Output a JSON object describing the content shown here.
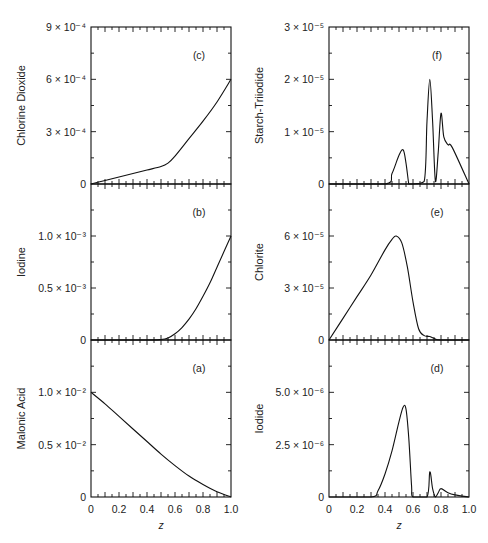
{
  "chart_data": [
    {
      "id": "c",
      "type": "line",
      "panel_label": "(c)",
      "ylabel": "Chlorine Dioxide",
      "xlabel": "",
      "ylim": [
        0,
        0.0009
      ],
      "yticks": [
        {
          "v": 0,
          "label": "0"
        },
        {
          "v": 0.0003,
          "label": "3 × 10⁻⁴"
        },
        {
          "v": 0.0006,
          "label": "6 × 10⁻⁴"
        },
        {
          "v": 0.0009,
          "label": "9 × 10⁻⁴"
        }
      ],
      "x": [
        0,
        0.1,
        0.2,
        0.3,
        0.4,
        0.5,
        0.55,
        0.6,
        0.7,
        0.8,
        0.9,
        1.0
      ],
      "y": [
        0,
        2e-05,
        4e-05,
        6e-05,
        8e-05,
        0.0001,
        0.00012,
        0.00016,
        0.00026,
        0.00036,
        0.00047,
        0.0006
      ]
    },
    {
      "id": "b",
      "type": "line",
      "panel_label": "(b)",
      "ylabel": "Iodine",
      "xlabel": "",
      "ylim": [
        0,
        0.0015
      ],
      "yticks": [
        {
          "v": 0,
          "label": "0"
        },
        {
          "v": 0.0005,
          "label": "0.5 × 10⁻³"
        },
        {
          "v": 0.001,
          "label": "1.0 × 10⁻³"
        }
      ],
      "x": [
        0,
        0.4,
        0.5,
        0.55,
        0.6,
        0.65,
        0.7,
        0.75,
        0.8,
        0.85,
        0.9,
        0.95,
        1.0
      ],
      "y": [
        0,
        0,
        5e-06,
        2e-05,
        6e-05,
        0.00012,
        0.0002,
        0.0003,
        0.00042,
        0.00055,
        0.0007,
        0.00085,
        0.001
      ]
    },
    {
      "id": "a",
      "type": "line",
      "panel_label": "(a)",
      "ylabel": "Malonic Acid",
      "xlabel": "z",
      "ylim": [
        0,
        0.015
      ],
      "yticks": [
        {
          "v": 0,
          "label": "0"
        },
        {
          "v": 0.005,
          "label": "0.5 × 10⁻²"
        },
        {
          "v": 0.01,
          "label": "1.0 × 10⁻²"
        }
      ],
      "xticks": [
        "0",
        "0.2",
        "0.4",
        "0.6",
        "0.8",
        "1.0"
      ],
      "x": [
        0,
        0.1,
        0.2,
        0.3,
        0.4,
        0.5,
        0.6,
        0.7,
        0.8,
        0.9,
        1.0
      ],
      "y": [
        0.01,
        0.0089,
        0.0077,
        0.0065,
        0.0053,
        0.0041,
        0.003,
        0.002,
        0.0012,
        0.0005,
        0
      ]
    },
    {
      "id": "f",
      "type": "line",
      "panel_label": "(f)",
      "ylabel": "Starch-Triiodide",
      "xlabel": "",
      "ylim": [
        0,
        3e-05
      ],
      "yticks": [
        {
          "v": 0,
          "label": "0"
        },
        {
          "v": 1e-05,
          "label": "1 × 10⁻⁵"
        },
        {
          "v": 2e-05,
          "label": "2 × 10⁻⁵"
        },
        {
          "v": 3e-05,
          "label": "3 × 10⁻⁵"
        }
      ],
      "x": [
        0,
        0.4,
        0.45,
        0.5,
        0.53,
        0.55,
        0.57,
        0.58,
        0.6,
        0.68,
        0.7,
        0.72,
        0.74,
        0.76,
        0.78,
        0.8,
        0.82,
        0.85,
        0.88,
        1.0
      ],
      "y": [
        0,
        0,
        2e-06,
        5.5e-06,
        6.5e-06,
        4e-06,
        0,
        0,
        0,
        5e-07,
        1.2e-05,
        2e-05,
        1.2e-05,
        5e-07,
        6e-06,
        1.35e-05,
        9e-06,
        7.5e-06,
        7e-06,
        0
      ]
    },
    {
      "id": "e",
      "type": "line",
      "panel_label": "(e)",
      "ylabel": "Chlorite",
      "xlabel": "",
      "ylim": [
        0,
        9e-05
      ],
      "yticks": [
        {
          "v": 0,
          "label": "0"
        },
        {
          "v": 3e-05,
          "label": "3 × 10⁻⁵"
        },
        {
          "v": 6e-05,
          "label": "6 × 10⁻⁵"
        }
      ],
      "x": [
        0,
        0.1,
        0.2,
        0.3,
        0.4,
        0.45,
        0.48,
        0.52,
        0.56,
        0.6,
        0.64,
        0.68,
        0.72,
        0.76,
        0.8,
        1.0
      ],
      "y": [
        0,
        1.25e-05,
        2.5e-05,
        3.75e-05,
        5.2e-05,
        5.8e-05,
        6e-05,
        5.6e-05,
        4.2e-05,
        2.2e-05,
        6.5e-06,
        2.5e-06,
        2e-06,
        5e-07,
        0,
        0
      ]
    },
    {
      "id": "d",
      "type": "line",
      "panel_label": "(d)",
      "ylabel": "Iodide",
      "xlabel": "z",
      "ylim": [
        0,
        7.5e-06
      ],
      "yticks": [
        {
          "v": 0,
          "label": "0"
        },
        {
          "v": 2.5e-06,
          "label": "2.5 × 10⁻⁶"
        },
        {
          "v": 5e-06,
          "label": "5.0 × 10⁻⁶"
        }
      ],
      "xticks": [
        "0",
        "0.2",
        "0.4",
        "0.6",
        "0.8",
        "1.0"
      ],
      "x": [
        0,
        0.3,
        0.35,
        0.4,
        0.45,
        0.5,
        0.53,
        0.55,
        0.57,
        0.59,
        0.6,
        0.7,
        0.72,
        0.74,
        0.76,
        0.78,
        0.8,
        0.85,
        0.9,
        1.0
      ],
      "y": [
        0,
        0,
        3e-07,
        1.1e-06,
        2.2e-06,
        3.6e-06,
        4.3e-06,
        4.2e-06,
        2.8e-06,
        5e-07,
        0,
        0,
        1.2e-06,
        4e-07,
        0,
        2e-07,
        4e-07,
        2e-07,
        1e-07,
        0
      ]
    }
  ]
}
